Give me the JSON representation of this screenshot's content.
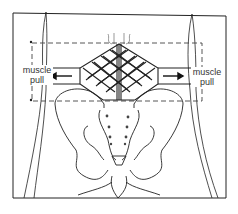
{
  "diagram": {
    "labels": {
      "left": [
        "muscle",
        "pull"
      ],
      "right": [
        "muscle",
        "pull"
      ]
    },
    "colors": {
      "line": "#222222",
      "dash": "#444444",
      "background": "#ffffff"
    }
  }
}
